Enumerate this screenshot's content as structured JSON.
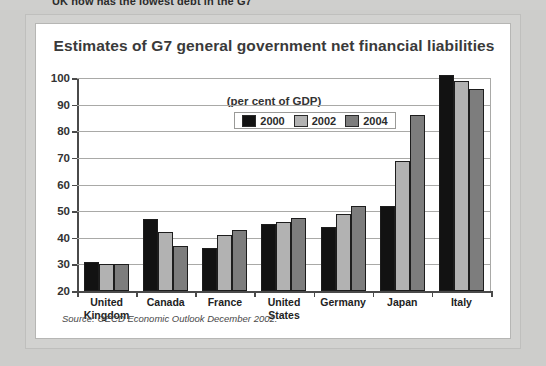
{
  "page": {
    "headline_partial": "UK now has the lowest debt in the G7"
  },
  "figure": {
    "title": "Estimates of G7 general government net financial liabilities",
    "units_note": "(per cent of GDP)",
    "source": "Source: OECD Economic Outlook December 2002."
  },
  "chart_data": {
    "type": "bar",
    "title": "Estimates of G7 general government net financial liabilities",
    "subtitle": "(per cent of GDP)",
    "xlabel": "",
    "ylabel": "",
    "ylim": [
      20,
      100
    ],
    "yticks": [
      20,
      30,
      40,
      50,
      60,
      70,
      80,
      90,
      100
    ],
    "ytick_labels": [
      "20",
      "30",
      "40",
      "50",
      "60",
      "70",
      "80",
      "90",
      "100"
    ],
    "grid": true,
    "legend_position": "top-center",
    "categories": [
      "United Kingdom",
      "Canada",
      "France",
      "United States",
      "Germany",
      "Japan",
      "Italy"
    ],
    "category_lines": [
      [
        "United",
        "Kingdom"
      ],
      [
        "Canada"
      ],
      [
        "France"
      ],
      [
        "United",
        "States"
      ],
      [
        "Germany"
      ],
      [
        "Japan"
      ],
      [
        "Italy"
      ]
    ],
    "series": [
      {
        "name": "2000",
        "color": "#121212",
        "values": [
          31,
          47,
          36,
          45,
          44,
          52,
          101
        ]
      },
      {
        "name": "2002",
        "color": "#b2b2b2",
        "values": [
          30,
          42,
          41,
          46,
          49,
          69,
          99
        ]
      },
      {
        "name": "2004",
        "color": "#7d7d7d",
        "values": [
          30,
          37,
          43,
          47.5,
          52,
          86,
          96
        ]
      }
    ]
  }
}
